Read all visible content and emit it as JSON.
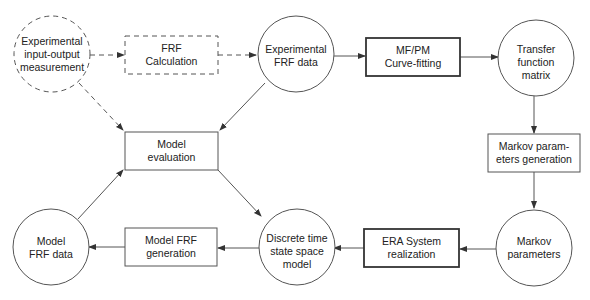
{
  "diagram": {
    "type": "flowchart",
    "nodes": [
      {
        "id": "exp_io",
        "shape": "circle",
        "style": "dashed",
        "lines": [
          "Experimental",
          "input-output",
          "measurement"
        ]
      },
      {
        "id": "frf_calc",
        "shape": "rect",
        "style": "dashed",
        "lines": [
          "FRF",
          "Calculation"
        ]
      },
      {
        "id": "exp_frf",
        "shape": "circle",
        "style": "solid",
        "lines": [
          "Experimental",
          "FRF data"
        ]
      },
      {
        "id": "mfpm",
        "shape": "rect",
        "style": "bold",
        "lines": [
          "MF/PM",
          "Curve-fitting"
        ]
      },
      {
        "id": "tfm",
        "shape": "circle",
        "style": "solid",
        "lines": [
          "Transfer",
          "function",
          "matrix"
        ]
      },
      {
        "id": "model_eval",
        "shape": "rect",
        "style": "solid",
        "lines": [
          "Model",
          "evaluation"
        ]
      },
      {
        "id": "markov_gen",
        "shape": "rect",
        "style": "solid",
        "lines": [
          "Markov param-",
          "eters generation"
        ]
      },
      {
        "id": "model_frf_data",
        "shape": "circle",
        "style": "solid",
        "lines": [
          "Model",
          "FRF data"
        ]
      },
      {
        "id": "model_frf_gen",
        "shape": "rect",
        "style": "solid",
        "lines": [
          "Model FRF",
          "generation"
        ]
      },
      {
        "id": "dtss",
        "shape": "circle",
        "style": "solid",
        "lines": [
          "Discrete time",
          "state space",
          "model"
        ]
      },
      {
        "id": "era",
        "shape": "rect",
        "style": "bold",
        "lines": [
          "ERA System",
          "realization"
        ]
      },
      {
        "id": "markov_params",
        "shape": "circle",
        "style": "solid",
        "lines": [
          "Markov",
          "parameters"
        ]
      }
    ],
    "edges": [
      {
        "from": "exp_io",
        "to": "frf_calc",
        "style": "dashed"
      },
      {
        "from": "frf_calc",
        "to": "exp_frf",
        "style": "dashed"
      },
      {
        "from": "exp_io",
        "to": "model_eval",
        "style": "dashed"
      },
      {
        "from": "exp_frf",
        "to": "mfpm",
        "style": "solid"
      },
      {
        "from": "exp_frf",
        "to": "model_eval",
        "style": "solid"
      },
      {
        "from": "mfpm",
        "to": "tfm",
        "style": "solid"
      },
      {
        "from": "tfm",
        "to": "markov_gen",
        "style": "solid"
      },
      {
        "from": "markov_gen",
        "to": "markov_params",
        "style": "solid"
      },
      {
        "from": "markov_params",
        "to": "era",
        "style": "solid"
      },
      {
        "from": "era",
        "to": "dtss",
        "style": "solid"
      },
      {
        "from": "dtss",
        "to": "model_frf_gen",
        "style": "solid"
      },
      {
        "from": "model_frf_gen",
        "to": "model_frf_data",
        "style": "solid"
      },
      {
        "from": "model_frf_data",
        "to": "model_eval",
        "style": "solid"
      },
      {
        "from": "model_eval",
        "to": "dtss",
        "style": "solid"
      }
    ]
  },
  "labels": {
    "exp_io": {
      "l1": "Experimental",
      "l2": "input-output",
      "l3": "measurement"
    },
    "frf_calc": {
      "l1": "FRF",
      "l2": "Calculation"
    },
    "exp_frf": {
      "l1": "Experimental",
      "l2": "FRF data"
    },
    "mfpm": {
      "l1": "MF/PM",
      "l2": "Curve-fitting"
    },
    "tfm": {
      "l1": "Transfer",
      "l2": "function",
      "l3": "matrix"
    },
    "model_eval": {
      "l1": "Model",
      "l2": "evaluation"
    },
    "markov_gen": {
      "l1": "Markov param-",
      "l2": "eters generation"
    },
    "model_frf_data": {
      "l1": "Model",
      "l2": "FRF data"
    },
    "model_frf_gen": {
      "l1": "Model FRF",
      "l2": "generation"
    },
    "dtss": {
      "l1": "Discrete time",
      "l2": "state space",
      "l3": "model"
    },
    "era": {
      "l1": "ERA System",
      "l2": "realization"
    },
    "markov_params": {
      "l1": "Markov",
      "l2": "parameters"
    }
  },
  "colors": {
    "stroke": "#444444",
    "text": "#222222",
    "background": "#ffffff"
  }
}
